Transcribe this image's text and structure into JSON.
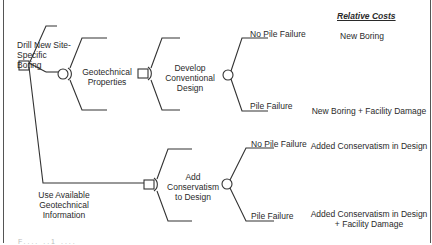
{
  "diagram": {
    "type": "decision-tree",
    "header": "Relative Costs",
    "decisions": {
      "root": {
        "node": "decision-square"
      },
      "option_1": {
        "label": "Drill New Site-Specific Boring",
        "lines": [
          "Drill New Site-",
          "Specific",
          "Boring"
        ]
      },
      "option_2": {
        "label": "Use Available Geotechnical Information",
        "lines": [
          "Use Available",
          "Geotechnical",
          "Information"
        ]
      }
    },
    "chance_geotech": {
      "label": "Geotechnical Properties",
      "lines": [
        "Geotechnical",
        "Properties"
      ]
    },
    "develop_design": {
      "label": "Develop Conventional Design",
      "lines": [
        "Develop",
        "Conventional",
        "Design"
      ]
    },
    "add_conservatism": {
      "label": "Add Conservatism to Design",
      "lines": [
        "Add",
        "Conservatism",
        "to Design"
      ]
    },
    "outcomes": {
      "upper": {
        "no_failure": "No Pile Failure",
        "failure": "Pile Failure",
        "cost_no_failure": "New Boring",
        "cost_failure": "New Boring + Facility Damage"
      },
      "lower": {
        "no_failure": "No Pile Failure",
        "failure": "Pile Failure",
        "cost_no_failure": "Added Conservatism in Design",
        "cost_failure_line1": "Added Conservatism in Design",
        "cost_failure_line2": "+ Facility Damage"
      }
    },
    "caption": "F.... ..1 ...."
  }
}
